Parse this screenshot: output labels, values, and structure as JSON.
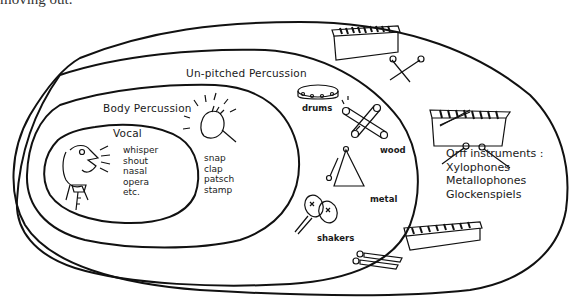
{
  "page": {
    "cropped_caption": "moving out."
  },
  "diagram": {
    "regions": [
      {
        "id": "orff",
        "label": "Orff instruments :",
        "items": [
          "Xylophones",
          "Metallophones",
          "Glockenspiels"
        ]
      },
      {
        "id": "unpitched",
        "label": "Un-pitched Percussion"
      },
      {
        "id": "body",
        "label": "Body Percussion",
        "items": [
          "snap",
          "clap",
          "patsch",
          "stamp"
        ]
      },
      {
        "id": "vocal",
        "label": "Vocal",
        "items": [
          "whisper",
          "shout",
          "nasal",
          "opera",
          "etc."
        ]
      }
    ],
    "unpitched_groups": {
      "drums": "drums",
      "wood": "wood",
      "metal": "metal",
      "shakers": "shakers"
    },
    "illustrations": [
      "singing-person",
      "clapping-hands",
      "tambourine",
      "claves",
      "triangle",
      "maracas",
      "xylophone",
      "mallets"
    ],
    "stroke_color": "#111111",
    "background": "#ffffff"
  }
}
